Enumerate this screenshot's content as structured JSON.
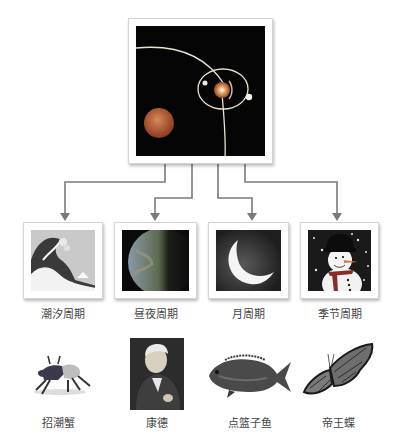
{
  "center": {
    "name": "solar-system",
    "icon": "orbit-diagram"
  },
  "cycles": [
    {
      "label": "潮汐周期",
      "icon": "great-wave"
    },
    {
      "label": "昼夜周期",
      "icon": "earth-half-lit"
    },
    {
      "label": "月周期",
      "icon": "crescent-moon"
    },
    {
      "label": "季节周期",
      "icon": "snowman"
    }
  ],
  "organisms": [
    {
      "label": "招潮蟹",
      "icon": "fiddler-crab"
    },
    {
      "label": "康德",
      "icon": "kant-portrait"
    },
    {
      "label": "点篮子鱼",
      "icon": "rabbitfish"
    },
    {
      "label": "帝王蝶",
      "icon": "monarch-butterfly"
    }
  ],
  "colors": {
    "connector": "#7a7a7a",
    "frame_border": "#d4d4d4",
    "label_text": "#444444",
    "space_bg": "#050505"
  }
}
